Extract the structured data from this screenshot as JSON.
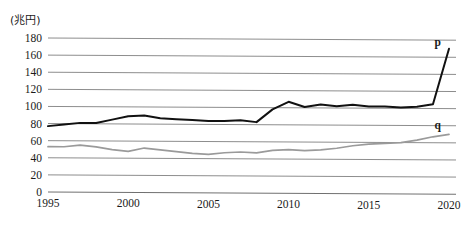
{
  "chart_data": {
    "type": "line",
    "title": "",
    "subtitle": "",
    "xlabel": "",
    "ylabel": "(兆円)",
    "unit_label": "(兆円)",
    "grid": true,
    "legend_position": "inline-end-labels",
    "xlim": [
      1995,
      2020
    ],
    "ylim": [
      0,
      180
    ],
    "ytick_step": 20,
    "x": [
      1995,
      1996,
      1997,
      1998,
      1999,
      2000,
      2001,
      2002,
      2003,
      2004,
      2005,
      2006,
      2007,
      2008,
      2009,
      2010,
      2011,
      2012,
      2013,
      2014,
      2015,
      2016,
      2017,
      2018,
      2019,
      2020
    ],
    "xtick_labels": [
      "1995",
      "2000",
      "2005",
      "2010",
      "2015",
      "2020"
    ],
    "xticks": [
      1995,
      2000,
      2005,
      2010,
      2015,
      2020
    ],
    "ytick_labels": [
      "0",
      "20",
      "40",
      "60",
      "80",
      "100",
      "120",
      "140",
      "160",
      "180"
    ],
    "yticks": [
      0,
      20,
      40,
      60,
      80,
      100,
      120,
      140,
      160,
      180
    ],
    "series": [
      {
        "name": "p",
        "label": "p",
        "color": "#111111",
        "values": [
          77,
          79,
          81,
          81,
          85,
          89,
          90,
          87,
          86,
          85,
          84,
          84,
          85,
          83,
          98,
          107,
          101,
          104,
          102,
          104,
          102,
          102,
          101,
          102,
          105,
          170
        ]
      },
      {
        "name": "q",
        "label": "q",
        "color": "#9a9a9a",
        "values": [
          53,
          53,
          55,
          53,
          50,
          48,
          52,
          50,
          48,
          46,
          45,
          47,
          48,
          47,
          50,
          51,
          50,
          51,
          53,
          56,
          58,
          59,
          60,
          63,
          67,
          70
        ]
      }
    ],
    "annotations": [
      {
        "text": "p",
        "series": "p",
        "x": 2019.3,
        "y": 173
      },
      {
        "text": "q",
        "series": "q",
        "x": 2019.3,
        "y": 76
      }
    ]
  }
}
